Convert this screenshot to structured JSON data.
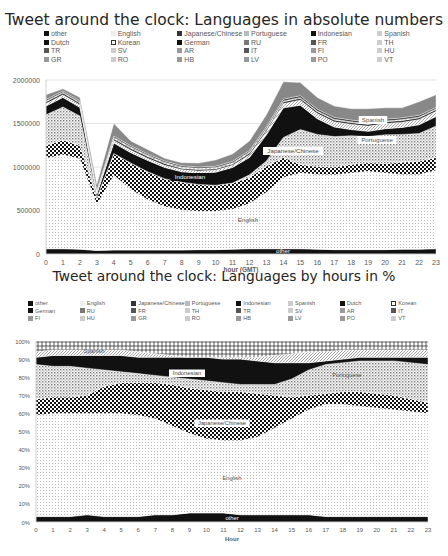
{
  "chart_data": [
    {
      "type": "area",
      "stacked": true,
      "title": "Tweet around the clock: Languages in absolute numbers",
      "xlabel": "hour (GMT)",
      "ylabel": "",
      "x": [
        0,
        1,
        2,
        3,
        4,
        5,
        6,
        7,
        8,
        9,
        10,
        11,
        12,
        13,
        14,
        15,
        16,
        17,
        18,
        19,
        20,
        21,
        22,
        23
      ],
      "y_ticks": [
        "0",
        "500000",
        "1000000",
        "1500000",
        "2000000"
      ],
      "ylim": [
        0,
        2000000
      ],
      "grid": true,
      "legend_position": "top",
      "legend": [
        "other",
        "English",
        "Japanese/Chinese",
        "Portuguese",
        "Indonesian",
        "Spanish",
        "Dutch",
        "Korean",
        "German",
        "RU",
        "FR",
        "TH",
        "TR",
        "SV",
        "AR",
        "IT",
        "FI",
        "HU",
        "GR",
        "RO",
        "HB",
        "LV",
        "PO",
        "VT"
      ],
      "series": [
        {
          "name": "other",
          "values": [
            60000,
            60000,
            55000,
            40000,
            45000,
            45000,
            45000,
            45000,
            45000,
            50000,
            50000,
            55000,
            60000,
            60000,
            60000,
            60000,
            55000,
            50000,
            50000,
            50000,
            50000,
            55000,
            55000,
            60000
          ]
        },
        {
          "name": "English",
          "values": [
            1040000,
            1080000,
            1040000,
            530000,
            860000,
            700000,
            580000,
            500000,
            460000,
            440000,
            440000,
            460000,
            520000,
            650000,
            820000,
            870000,
            860000,
            860000,
            880000,
            900000,
            880000,
            860000,
            860000,
            900000
          ]
        },
        {
          "name": "Japanese/Chinese",
          "values": [
            150000,
            170000,
            150000,
            80000,
            250000,
            300000,
            320000,
            320000,
            320000,
            310000,
            300000,
            300000,
            300000,
            300000,
            230000,
            100000,
            90000,
            90000,
            100000,
            100000,
            110000,
            140000,
            150000,
            150000
          ]
        },
        {
          "name": "Portuguese",
          "values": [
            350000,
            380000,
            340000,
            0,
            0,
            0,
            0,
            0,
            0,
            0,
            0,
            0,
            30000,
            60000,
            230000,
            400000,
            370000,
            350000,
            330000,
            300000,
            330000,
            320000,
            320000,
            360000
          ]
        },
        {
          "name": "Indonesian",
          "values": [
            100000,
            110000,
            100000,
            40000,
            120000,
            120000,
            130000,
            130000,
            120000,
            130000,
            150000,
            180000,
            200000,
            300000,
            340000,
            280000,
            180000,
            110000,
            70000,
            60000,
            70000,
            80000,
            100000,
            110000
          ]
        },
        {
          "name": "Spanish",
          "values": [
            30000,
            30000,
            30000,
            10000,
            30000,
            30000,
            25000,
            25000,
            25000,
            25000,
            25000,
            25000,
            30000,
            40000,
            50000,
            60000,
            60000,
            60000,
            60000,
            60000,
            60000,
            60000,
            60000,
            60000
          ]
        },
        {
          "name": "Dutch",
          "values": [
            20000,
            20000,
            20000,
            10000,
            20000,
            20000,
            20000,
            20000,
            15000,
            15000,
            15000,
            15000,
            20000,
            20000,
            20000,
            20000,
            20000,
            20000,
            20000,
            20000,
            20000,
            20000,
            20000,
            20000
          ]
        },
        {
          "name": "Korean",
          "values": [
            10000,
            10000,
            10000,
            10000,
            15000,
            15000,
            15000,
            15000,
            15000,
            15000,
            15000,
            15000,
            15000,
            15000,
            10000,
            10000,
            10000,
            10000,
            10000,
            10000,
            10000,
            10000,
            10000,
            10000
          ]
        },
        {
          "name": "German",
          "values": [
            15000,
            15000,
            15000,
            10000,
            15000,
            15000,
            15000,
            15000,
            15000,
            15000,
            15000,
            15000,
            15000,
            20000,
            20000,
            20000,
            20000,
            20000,
            20000,
            20000,
            20000,
            20000,
            20000,
            15000
          ]
        },
        {
          "name": "Other small (RU..VT)",
          "values": [
            55000,
            25000,
            40000,
            70000,
            145000,
            55000,
            50000,
            30000,
            35000,
            45000,
            70000,
            85000,
            110000,
            135000,
            200000,
            150000,
            135000,
            130000,
            130000,
            150000,
            130000,
            115000,
            155000,
            145000
          ]
        }
      ],
      "totals_approx": [
        1830000,
        1900000,
        1800000,
        800000,
        1500000,
        1300000,
        1200000,
        1100000,
        1050000,
        1050000,
        1080000,
        1150000,
        1300000,
        1600000,
        1980000,
        1970000,
        1800000,
        1700000,
        1670000,
        1670000,
        1680000,
        1680000,
        1750000,
        1830000
      ],
      "annotations": [
        "other",
        "English",
        "Japanese/Chinese",
        "Indonesian",
        "Portuguese",
        "Spanish"
      ]
    },
    {
      "type": "area",
      "stacked": true,
      "percent": true,
      "title": "Tweet around the clock: Languages by hours in %",
      "xlabel": "Hour",
      "ylabel": "",
      "x": [
        0,
        1,
        2,
        3,
        4,
        5,
        6,
        7,
        8,
        9,
        10,
        11,
        12,
        13,
        14,
        15,
        16,
        17,
        18,
        19,
        20,
        21,
        22,
        23
      ],
      "y_ticks": [
        "0%",
        "10%",
        "20%",
        "30%",
        "40%",
        "50%",
        "60%",
        "70%",
        "80%",
        "90%",
        "100%"
      ],
      "ylim": [
        0,
        100
      ],
      "grid": false,
      "legend_position": "top",
      "legend": [
        "other",
        "English",
        "Japanese/Chinese",
        "Portuguese",
        "Indonesian",
        "Spanish",
        "Dutch",
        "Korean",
        "German",
        "RU",
        "FR",
        "TH",
        "TR",
        "SV",
        "AR",
        "IT",
        "FI",
        "HU",
        "GR",
        "RO",
        "HB",
        "LV",
        "PO",
        "VT"
      ],
      "cumulative_top_pct": {
        "other": [
          3,
          3,
          3,
          4,
          3,
          3,
          3,
          4,
          4,
          5,
          5,
          5,
          4,
          4,
          4,
          4,
          4,
          3,
          3,
          3,
          3,
          3,
          3,
          3
        ],
        "English": [
          59,
          60,
          60,
          60,
          60,
          60,
          59,
          57,
          53,
          49,
          46,
          45,
          45,
          47,
          52,
          57,
          62,
          65,
          65,
          64,
          63,
          62,
          61,
          60
        ],
        "Japanese/Chinese": [
          68,
          69,
          69,
          70,
          75,
          77,
          77,
          77,
          76,
          74,
          73,
          72,
          72,
          71,
          70,
          69,
          70,
          71,
          72,
          72,
          71,
          70,
          68,
          66
        ],
        "Portuguese": [
          87,
          86,
          86,
          85,
          84,
          83,
          82,
          81,
          80,
          79,
          78,
          77,
          76,
          76,
          76,
          79,
          84,
          87,
          88,
          89,
          89,
          89,
          88,
          87
        ],
        "Indonesian": [
          91,
          92,
          92,
          92,
          92,
          92,
          91,
          91,
          91,
          91,
          91,
          90,
          90,
          89,
          88,
          88,
          88,
          89,
          90,
          91,
          91,
          91,
          91,
          91
        ],
        "Spanish": [
          94,
          95,
          95,
          95,
          95,
          95,
          94,
          93,
          92,
          91,
          91,
          91,
          91,
          91,
          92,
          93,
          94,
          94,
          95,
          95,
          95,
          95,
          95,
          95
        ],
        "rest": [
          100,
          100,
          100,
          100,
          100,
          100,
          100,
          100,
          100,
          100,
          100,
          100,
          100,
          100,
          100,
          100,
          100,
          100,
          100,
          100,
          100,
          100,
          100,
          100
        ]
      },
      "annotations": [
        "other",
        "English",
        "Japanese/Chinese",
        "Indonesian",
        "Portuguese",
        "Spanish"
      ]
    }
  ],
  "legend_items": [
    {
      "name": "other",
      "pattern": "solid-black"
    },
    {
      "name": "English",
      "pattern": "light-dots"
    },
    {
      "name": "Japanese/Chinese",
      "pattern": "checker"
    },
    {
      "name": "Portuguese",
      "pattern": "dots"
    },
    {
      "name": "Indonesian",
      "pattern": "solid-black"
    },
    {
      "name": "Spanish",
      "pattern": "light-diag"
    },
    {
      "name": "Dutch",
      "pattern": "solid-black"
    },
    {
      "name": "Korean",
      "pattern": "hatch"
    },
    {
      "name": "German",
      "pattern": "solid-black"
    },
    {
      "name": "RU",
      "pattern": "cross"
    },
    {
      "name": "FR",
      "pattern": "dark-grey"
    },
    {
      "name": "TH",
      "pattern": "light-grey"
    },
    {
      "name": "TR",
      "pattern": "dark-grey"
    },
    {
      "name": "SV",
      "pattern": "light-grey"
    },
    {
      "name": "AR",
      "pattern": "mid-grey"
    },
    {
      "name": "IT",
      "pattern": "dark-grey"
    },
    {
      "name": "FI",
      "pattern": "mid-grey"
    },
    {
      "name": "HU",
      "pattern": "light-grey"
    },
    {
      "name": "GR",
      "pattern": "mid-grey"
    },
    {
      "name": "RO",
      "pattern": "light-grey"
    },
    {
      "name": "HB",
      "pattern": "mid-grey"
    },
    {
      "name": "LV",
      "pattern": "mid-grey"
    },
    {
      "name": "PO",
      "pattern": "mid-grey"
    },
    {
      "name": "VT",
      "pattern": "light-grey"
    }
  ],
  "labels": {
    "chart1_title": "Tweet around the clock: Languages in absolute numbers",
    "chart2_title": "Tweet around the clock: Languages by hours in %",
    "chart1_xlabel": "hour (GMT)",
    "chart2_xlabel": "Hour",
    "other": "other",
    "english": "English",
    "japanese": "Japanese/Chinese",
    "indonesian": "Indonesian",
    "portuguese": "Portuguese",
    "spanish": "Spanish"
  },
  "colors": {
    "dark": "#111111",
    "grid": "#d9d9d9",
    "axis_text": "#595959",
    "title": "#262626"
  }
}
